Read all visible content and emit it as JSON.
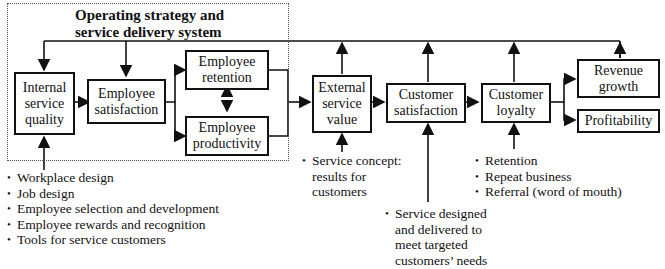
{
  "diagram": {
    "group": {
      "title_line1": "Operating strategy and",
      "title_line2": "service delivery system"
    },
    "nodes": {
      "internal_service_quality": "Internal service quality",
      "employee_satisfaction": "Employee satisfaction",
      "employee_retention": "Employee retention",
      "employee_productivity": "Employee productivity",
      "external_service_value": "External service value",
      "customer_satisfaction": "Customer satisfaction",
      "customer_loyalty": "Customer loyalty",
      "revenue_growth": "Revenue growth",
      "profitability": "Profitability"
    },
    "notes": {
      "internal_quality_inputs": [
        "Workplace design",
        "Job design",
        "Employee selection and development",
        "Employee rewards and recognition",
        "Tools for service customers"
      ],
      "service_concept": [
        "Service concept:",
        "results for",
        "customers"
      ],
      "service_design": [
        "Service designed",
        "and delivered to",
        "meet targeted",
        "customers’ needs"
      ],
      "loyalty_outcomes": [
        "Retention",
        "Repeat business",
        "Referral (word of mouth)"
      ]
    }
  }
}
